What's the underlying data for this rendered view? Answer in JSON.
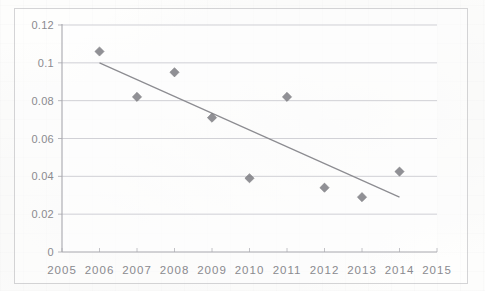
{
  "chart_data": {
    "type": "scatter",
    "title": "",
    "subtitle": "",
    "xlabel": "",
    "ylabel": "",
    "x": [
      2006,
      2007,
      2008,
      2009,
      2010,
      2011,
      2012,
      2013,
      2014
    ],
    "values": [
      0.106,
      0.082,
      0.095,
      0.071,
      0.039,
      0.082,
      0.034,
      0.029,
      0.0425
    ],
    "series": [
      {
        "name": "data-points",
        "marker": "diamond",
        "color": "#7d7d82",
        "points": [
          {
            "x": 2006,
            "y": 0.106
          },
          {
            "x": 2007,
            "y": 0.082
          },
          {
            "x": 2008,
            "y": 0.095
          },
          {
            "x": 2009,
            "y": 0.071
          },
          {
            "x": 2010,
            "y": 0.039
          },
          {
            "x": 2011,
            "y": 0.082
          },
          {
            "x": 2012,
            "y": 0.034
          },
          {
            "x": 2013,
            "y": 0.029
          },
          {
            "x": 2014,
            "y": 0.0425
          }
        ]
      },
      {
        "name": "linear-trendline",
        "type": "line",
        "color": "#8c8c91",
        "points": [
          {
            "x": 2006,
            "y": 0.1
          },
          {
            "x": 2014,
            "y": 0.029
          }
        ]
      }
    ],
    "xlim": [
      2005,
      2015
    ],
    "ylim": [
      0,
      0.12
    ],
    "xticks": [
      2005,
      2006,
      2007,
      2008,
      2009,
      2010,
      2011,
      2012,
      2013,
      2014,
      2015
    ],
    "xticklabels": [
      "2005",
      "2006",
      "2007",
      "2008",
      "2009",
      "2010",
      "2011",
      "2012",
      "2013",
      "2014",
      "2015"
    ],
    "yticks": [
      0,
      0.02,
      0.04,
      0.06,
      0.08,
      0.1,
      0.12
    ],
    "yticklabels": [
      "0",
      "0.02",
      "0.04",
      "0.06",
      "0.08",
      "0.1",
      "0.12"
    ],
    "grid": {
      "horizontal": true,
      "vertical": false
    },
    "legend": {
      "visible": false,
      "position": "none"
    },
    "colors": {
      "marker": "#7d7d82",
      "trendline": "#8c8c91",
      "gridline": "#c9c9cf",
      "axis": "#a8a8ae",
      "tick_text": "#8a8a8f",
      "background": "#fdfdfc"
    }
  }
}
